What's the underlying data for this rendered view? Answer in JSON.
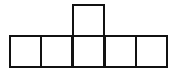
{
  "diagram": {
    "type": "net-of-cube-like-shape",
    "line_color": "#111111",
    "background": "#ffffff",
    "squares": [
      {
        "row": 1,
        "col": 3,
        "x": 72,
        "y": 4,
        "size": 33
      },
      {
        "row": 2,
        "col": 1,
        "x": 9,
        "y": 35,
        "size": 33
      },
      {
        "row": 2,
        "col": 2,
        "x": 40,
        "y": 35,
        "size": 33
      },
      {
        "row": 2,
        "col": 3,
        "x": 72,
        "y": 35,
        "size": 33
      },
      {
        "row": 2,
        "col": 4,
        "x": 104,
        "y": 35,
        "size": 33
      },
      {
        "row": 2,
        "col": 5,
        "x": 135,
        "y": 35,
        "size": 33
      }
    ]
  }
}
